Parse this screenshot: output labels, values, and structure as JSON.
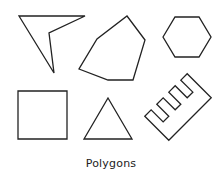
{
  "figure": {
    "caption": "Polygons",
    "stroke_color": "#222222",
    "background": "#ffffff",
    "shapes": [
      {
        "name": "concave-quadrilateral",
        "points": "19,16 85,16 49,33 54,73"
      },
      {
        "name": "irregular-hexagon",
        "points": "127,16 145,40 133,80 108,80 79,69 97,39"
      },
      {
        "name": "regular-hexagon",
        "points": "163,37 175,17 199,17 211,37 199,57 175,57"
      },
      {
        "name": "square",
        "points": "18,91 67,91 67,139 18,139"
      },
      {
        "name": "triangle",
        "points": "108,98 132,139 84,139"
      },
      {
        "name": "comb-polygon",
        "points": "-30,17 30,17 30,-17 21,-17 21,0 13,0 13,-17 4,-17 4,0 -4,0 -4,-17 -13,-17 -13,0 -21,0 -21,-17 -30,-17"
      }
    ]
  }
}
